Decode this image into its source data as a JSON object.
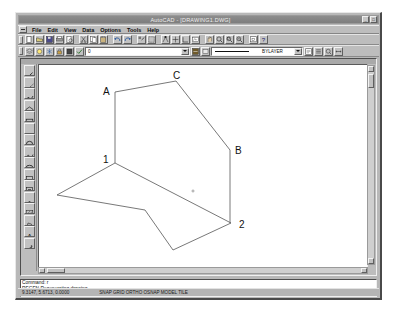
{
  "window": {
    "title": "AutoCAD - [DRAWING1.DWG]",
    "buttons": [
      "_",
      "□",
      "×"
    ]
  },
  "menu": {
    "items": [
      {
        "label": "File"
      },
      {
        "label": "Edit"
      },
      {
        "label": "View"
      },
      {
        "label": "Data"
      },
      {
        "label": "Options"
      },
      {
        "label": "Tools"
      },
      {
        "label": "Help"
      }
    ]
  },
  "toolbar_top": {
    "buttons": [
      {
        "name": "new-file-icon"
      },
      {
        "name": "open-file-icon"
      },
      {
        "name": "save-file-icon"
      },
      {
        "name": "print-icon"
      },
      {
        "name": "print-preview-icon"
      },
      {
        "name": "cut-icon"
      },
      {
        "name": "copy-icon"
      },
      {
        "name": "paste-icon"
      },
      {
        "name": "undo-icon"
      },
      {
        "name": "redo-icon"
      },
      {
        "name": "match-properties-icon"
      },
      {
        "name": "select-objects-icon"
      },
      {
        "name": "object-snap-icon"
      },
      {
        "name": "point-filters-icon"
      },
      {
        "name": "ucs-icon"
      },
      {
        "name": "named-views-icon"
      },
      {
        "name": "pan-realtime-icon"
      },
      {
        "name": "zoom-realtime-icon"
      },
      {
        "name": "zoom-window-icon"
      },
      {
        "name": "zoom-previous-icon"
      },
      {
        "name": "aerial-view-icon"
      },
      {
        "name": "help-icon"
      }
    ]
  },
  "toolbar_props": {
    "layer_buttons": [
      {
        "name": "layers-icon"
      },
      {
        "name": "layer-visibility-icon"
      },
      {
        "name": "layer-freeze-icon"
      },
      {
        "name": "layer-lock-icon"
      },
      {
        "name": "layer-color-icon"
      },
      {
        "name": "layer-current-icon"
      }
    ],
    "layer_value": "0",
    "color_value": "",
    "linetype_value": "BYLAYER",
    "right_buttons": [
      {
        "name": "linetype-manager-icon"
      },
      {
        "name": "properties-icon"
      },
      {
        "name": "list-icon"
      },
      {
        "name": "inquiry-icon"
      }
    ]
  },
  "draw_toolbar": {
    "buttons": [
      {
        "name": "line-icon"
      },
      {
        "name": "construction-line-icon"
      },
      {
        "name": "polyline-icon"
      },
      {
        "name": "polygon-icon"
      },
      {
        "name": "rectangle-icon"
      },
      {
        "name": "arc-icon"
      },
      {
        "name": "circle-icon"
      },
      {
        "name": "spline-icon"
      },
      {
        "name": "ellipse-icon"
      },
      {
        "name": "insert-block-icon"
      },
      {
        "name": "make-block-icon"
      },
      {
        "name": "point-icon"
      },
      {
        "name": "hatch-icon"
      },
      {
        "name": "region-icon"
      },
      {
        "name": "multiline-text-icon"
      },
      {
        "name": "dimension-icon"
      }
    ]
  },
  "drawing": {
    "labels": [
      {
        "text": "A",
        "x": 139,
        "y": 85
      },
      {
        "text": "C",
        "x": 209,
        "y": 69
      },
      {
        "text": "B",
        "x": 271,
        "y": 144
      },
      {
        "text": "1",
        "x": 139,
        "y": 153
      },
      {
        "text": "2",
        "x": 275,
        "y": 218
      }
    ],
    "upper_polygon_points": "151,82 212,71 266,140 266,213",
    "ridge_line_points": "151,82 151,153",
    "lower_polygon_points": "151,153 93,185 181,200 209,240 267,213",
    "fold_line_points": "151,153 267,213",
    "marker": {
      "x": 229,
      "y": 181
    }
  },
  "command_window": {
    "lines": [
      "Command: r",
      "REGEN Regenerating drawing.",
      "Command:"
    ],
    "prompt": "Command:"
  },
  "status_bar": {
    "coords": "9.3147, 5.6713, 0.0000",
    "modes": "SNAP   GRID   ORTHO   OSNAP   MODEL   TILE"
  }
}
